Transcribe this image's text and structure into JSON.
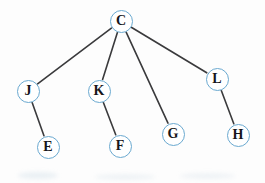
{
  "diagram": {
    "type": "tree",
    "width": 265,
    "height": 183,
    "background_color": "#fdfdfd",
    "node_border_color": "#6aa9d0",
    "node_fill_color": "#ffffff",
    "node_label_color": "#16161a",
    "edge_color": "#3a3a3c",
    "edge_width": 1.6,
    "node_radius": 11.5,
    "node_border_width": 1.6,
    "root": "C",
    "nodes": [
      {
        "id": "C",
        "label": "C",
        "x": 121,
        "y": 21,
        "r": 11.5,
        "level": 0,
        "font_size": 14
      },
      {
        "id": "J",
        "label": "J",
        "x": 28,
        "y": 91,
        "r": 11.5,
        "level": 1,
        "font_size": 14
      },
      {
        "id": "K",
        "label": "K",
        "x": 99,
        "y": 91,
        "r": 11.5,
        "level": 1,
        "font_size": 14
      },
      {
        "id": "L",
        "label": "L",
        "x": 217,
        "y": 79,
        "r": 11.5,
        "level": 1,
        "font_size": 14
      },
      {
        "id": "E",
        "label": "E",
        "x": 48,
        "y": 147,
        "r": 11.5,
        "level": 2,
        "font_size": 14
      },
      {
        "id": "F",
        "label": "F",
        "x": 120,
        "y": 146,
        "r": 11.5,
        "level": 2,
        "font_size": 14
      },
      {
        "id": "G",
        "label": "G",
        "x": 173,
        "y": 134,
        "r": 11.5,
        "level": 1,
        "font_size": 14
      },
      {
        "id": "H",
        "label": "H",
        "x": 238,
        "y": 135,
        "r": 11.5,
        "level": 2,
        "font_size": 14
      }
    ],
    "edges": [
      {
        "from": "C",
        "to": "J"
      },
      {
        "from": "C",
        "to": "K"
      },
      {
        "from": "C",
        "to": "G"
      },
      {
        "from": "C",
        "to": "L"
      },
      {
        "from": "J",
        "to": "E"
      },
      {
        "from": "K",
        "to": "F"
      },
      {
        "from": "L",
        "to": "H"
      }
    ]
  }
}
